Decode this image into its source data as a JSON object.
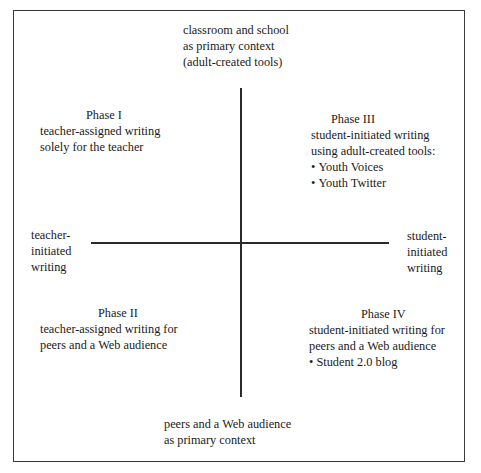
{
  "axes": {
    "top": [
      "classroom and school",
      "as primary context",
      "(adult-created tools)"
    ],
    "bottom": [
      "peers and a Web audience",
      "as primary context"
    ],
    "left": [
      "teacher-",
      "initiated",
      "writing"
    ],
    "right": [
      "student-",
      "initiated",
      "writing"
    ]
  },
  "quadrants": {
    "phase1": {
      "title": "Phase I",
      "lines": [
        "teacher-assigned writing",
        "solely for the teacher"
      ],
      "bullets": []
    },
    "phase3": {
      "title": "Phase III",
      "lines": [
        "student-initiated writing",
        "using adult-created tools:"
      ],
      "bullets": [
        "Youth Voices",
        "Youth Twitter"
      ]
    },
    "phase2": {
      "title": "Phase II",
      "lines": [
        "teacher-assigned writing for",
        "peers and a Web audience"
      ],
      "bullets": []
    },
    "phase4": {
      "title": "Phase IV",
      "lines": [
        "student-initiated writing for",
        "peers and a Web audience"
      ],
      "bullets": [
        "Student 2.0 blog"
      ]
    }
  }
}
